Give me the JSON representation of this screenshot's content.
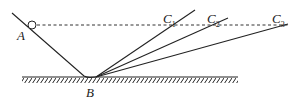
{
  "diagram": {
    "labels": {
      "A": "A",
      "B": "B",
      "C1": "C",
      "C1_sub": "1",
      "C2": "C",
      "C2_sub": "2",
      "C3": "C",
      "C3_sub": "3"
    },
    "colors": {
      "line": "#222222",
      "background": "#ffffff"
    }
  }
}
